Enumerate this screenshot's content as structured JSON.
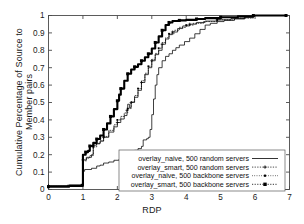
{
  "chart_data": {
    "type": "line",
    "title": "",
    "xlabel": "RDP",
    "ylabel": "Cumulative Percentage of Source to Member pairs",
    "xlim": [
      0,
      7
    ],
    "ylim": [
      0,
      1
    ],
    "xticks": [
      "0",
      "1",
      "2",
      "3",
      "4",
      "5",
      "6",
      "7"
    ],
    "yticks": [
      "0",
      "0.1",
      "0.2",
      "0.3",
      "0.4",
      "0.5",
      "0.6",
      "0.7",
      "0.8",
      "0.9",
      "1"
    ],
    "grid": false,
    "legend_position": "lower-right-inside",
    "series": [
      {
        "name": "overlay_naive, 500 random servers",
        "style": "solid-thin",
        "marker": "none",
        "color": "#000000",
        "points": [
          [
            0.0,
            0.02
          ],
          [
            0.55,
            0.025
          ],
          [
            0.95,
            0.028
          ],
          [
            1.0,
            0.105
          ],
          [
            1.05,
            0.115
          ],
          [
            1.25,
            0.122
          ],
          [
            1.4,
            0.135
          ],
          [
            1.5,
            0.14
          ],
          [
            1.6,
            0.152
          ],
          [
            1.75,
            0.158
          ],
          [
            1.9,
            0.168
          ],
          [
            2.05,
            0.175
          ],
          [
            2.2,
            0.182
          ],
          [
            2.35,
            0.188
          ],
          [
            2.45,
            0.195
          ],
          [
            2.5,
            0.225
          ],
          [
            2.6,
            0.235
          ],
          [
            2.7,
            0.248
          ],
          [
            2.75,
            0.285
          ],
          [
            2.85,
            0.292
          ],
          [
            2.9,
            0.3
          ],
          [
            2.95,
            0.345
          ],
          [
            3.0,
            0.43
          ],
          [
            3.05,
            0.52
          ],
          [
            3.1,
            0.6
          ],
          [
            3.15,
            0.66
          ],
          [
            3.2,
            0.7
          ],
          [
            3.3,
            0.74
          ],
          [
            3.4,
            0.765
          ],
          [
            3.5,
            0.78
          ],
          [
            3.6,
            0.8
          ],
          [
            3.7,
            0.815
          ],
          [
            3.8,
            0.83
          ],
          [
            3.95,
            0.85
          ],
          [
            4.1,
            0.87
          ],
          [
            4.25,
            0.895
          ],
          [
            4.4,
            0.92
          ],
          [
            4.55,
            0.945
          ],
          [
            4.7,
            0.955
          ],
          [
            4.9,
            0.965
          ],
          [
            5.1,
            0.972
          ],
          [
            5.4,
            0.98
          ],
          [
            5.7,
            0.99
          ],
          [
            5.95,
            1.0
          ],
          [
            6.9,
            1.0
          ]
        ]
      },
      {
        "name": "overlay_smart, 500 random servers",
        "style": "thin-plus",
        "marker": "plus",
        "color": "#000000",
        "points": [
          [
            0.0,
            0.022
          ],
          [
            0.6,
            0.026
          ],
          [
            0.98,
            0.03
          ],
          [
            1.0,
            0.17
          ],
          [
            1.1,
            0.185
          ],
          [
            1.25,
            0.2
          ],
          [
            1.3,
            0.255
          ],
          [
            1.4,
            0.265
          ],
          [
            1.5,
            0.278
          ],
          [
            1.6,
            0.3
          ],
          [
            1.75,
            0.33
          ],
          [
            1.9,
            0.36
          ],
          [
            2.0,
            0.385
          ],
          [
            2.1,
            0.405
          ],
          [
            2.2,
            0.425
          ],
          [
            2.28,
            0.455
          ],
          [
            2.3,
            0.49
          ],
          [
            2.35,
            0.47
          ],
          [
            2.4,
            0.5
          ],
          [
            2.5,
            0.53
          ],
          [
            2.6,
            0.57
          ],
          [
            2.7,
            0.615
          ],
          [
            2.8,
            0.66
          ],
          [
            2.9,
            0.7
          ],
          [
            3.0,
            0.74
          ],
          [
            3.1,
            0.775
          ],
          [
            3.2,
            0.8
          ],
          [
            3.3,
            0.835
          ],
          [
            3.4,
            0.865
          ],
          [
            3.5,
            0.89
          ],
          [
            3.6,
            0.905
          ],
          [
            3.75,
            0.925
          ],
          [
            3.9,
            0.94
          ],
          [
            4.1,
            0.95
          ],
          [
            4.3,
            0.96
          ],
          [
            4.55,
            0.968
          ],
          [
            4.9,
            0.975
          ],
          [
            5.3,
            0.983
          ],
          [
            5.7,
            0.992
          ],
          [
            5.95,
            1.0
          ],
          [
            6.9,
            1.0
          ]
        ]
      },
      {
        "name": "overlay_naive, 500 backbone servers",
        "style": "dotted-sq",
        "marker": "small-square",
        "color": "#000000",
        "points": [
          [
            0.0,
            0.018
          ],
          [
            0.6,
            0.022
          ],
          [
            0.98,
            0.026
          ],
          [
            1.0,
            0.165
          ],
          [
            1.1,
            0.18
          ],
          [
            1.2,
            0.195
          ],
          [
            1.3,
            0.245
          ],
          [
            1.4,
            0.262
          ],
          [
            1.5,
            0.28
          ],
          [
            1.6,
            0.305
          ],
          [
            1.75,
            0.34
          ],
          [
            1.9,
            0.372
          ],
          [
            2.0,
            0.4
          ],
          [
            2.1,
            0.42
          ],
          [
            2.2,
            0.44
          ],
          [
            2.3,
            0.465
          ],
          [
            2.4,
            0.505
          ],
          [
            2.5,
            0.54
          ],
          [
            2.6,
            0.58
          ],
          [
            2.7,
            0.625
          ],
          [
            2.8,
            0.668
          ],
          [
            2.9,
            0.708
          ],
          [
            3.0,
            0.748
          ],
          [
            3.1,
            0.782
          ],
          [
            3.2,
            0.812
          ],
          [
            3.3,
            0.845
          ],
          [
            3.4,
            0.872
          ],
          [
            3.5,
            0.895
          ],
          [
            3.65,
            0.915
          ],
          [
            3.8,
            0.932
          ],
          [
            4.0,
            0.945
          ],
          [
            4.2,
            0.955
          ],
          [
            4.5,
            0.965
          ],
          [
            4.9,
            0.975
          ],
          [
            5.4,
            0.985
          ],
          [
            5.95,
            1.0
          ],
          [
            6.9,
            1.0
          ]
        ]
      },
      {
        "name": "overlay_smart, 500 backbone servers",
        "style": "thick-sq",
        "marker": "filled-square",
        "color": "#000000",
        "points": [
          [
            0.0,
            0.016
          ],
          [
            0.6,
            0.02
          ],
          [
            0.98,
            0.024
          ],
          [
            1.0,
            0.2
          ],
          [
            1.08,
            0.215
          ],
          [
            1.15,
            0.222
          ],
          [
            1.2,
            0.25
          ],
          [
            1.3,
            0.268
          ],
          [
            1.4,
            0.29
          ],
          [
            1.5,
            0.31
          ],
          [
            1.6,
            0.345
          ],
          [
            1.7,
            0.38
          ],
          [
            1.8,
            0.42
          ],
          [
            1.9,
            0.462
          ],
          [
            2.0,
            0.51
          ],
          [
            2.05,
            0.545
          ],
          [
            2.1,
            0.58
          ],
          [
            2.2,
            0.625
          ],
          [
            2.3,
            0.665
          ],
          [
            2.4,
            0.69
          ],
          [
            2.5,
            0.705
          ],
          [
            2.6,
            0.72
          ],
          [
            2.7,
            0.74
          ],
          [
            2.8,
            0.76
          ],
          [
            2.9,
            0.78
          ],
          [
            3.0,
            0.81
          ],
          [
            3.1,
            0.845
          ],
          [
            3.2,
            0.88
          ],
          [
            3.3,
            0.915
          ],
          [
            3.4,
            0.945
          ],
          [
            3.5,
            0.96
          ],
          [
            3.6,
            0.968
          ],
          [
            3.8,
            0.972
          ],
          [
            4.0,
            0.975
          ],
          [
            4.3,
            0.98
          ],
          [
            4.55,
            0.985
          ],
          [
            5.0,
            0.99
          ],
          [
            5.5,
            0.995
          ],
          [
            5.95,
            1.0
          ],
          [
            6.4,
            1.0
          ],
          [
            6.9,
            1.0
          ]
        ]
      }
    ]
  }
}
